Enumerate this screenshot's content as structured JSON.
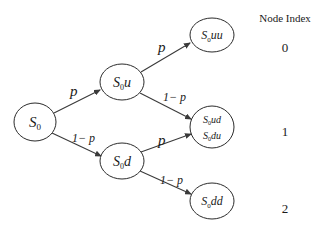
{
  "index_header": "Node Index",
  "node_indices": [
    "0",
    "1",
    "2"
  ],
  "nodes": [
    {
      "id": "S0",
      "base": "S",
      "sub": "0",
      "suffix": "",
      "cx": 35,
      "cy": 122,
      "rx": 21,
      "ry": 19
    },
    {
      "id": "S0u",
      "base": "S",
      "sub": "0",
      "suffix": "u",
      "cx": 122,
      "cy": 82,
      "rx": 22,
      "ry": 18
    },
    {
      "id": "S0d",
      "base": "S",
      "sub": "0",
      "suffix": "d",
      "cx": 122,
      "cy": 161,
      "rx": 22,
      "ry": 18
    },
    {
      "id": "S0uu",
      "base": "S",
      "sub": "0",
      "suffix": "uu",
      "cx": 212,
      "cy": 35,
      "rx": 22,
      "ry": 17
    },
    {
      "id": "S0ud_du",
      "lines": [
        {
          "base": "S",
          "sub": "0",
          "suffix": "ud"
        },
        {
          "base": "S",
          "sub": "0",
          "suffix": "du"
        }
      ],
      "cx": 212,
      "cy": 127,
      "rx": 22,
      "ry": 21
    },
    {
      "id": "S0dd",
      "base": "S",
      "sub": "0",
      "suffix": "dd",
      "cx": 212,
      "cy": 201,
      "rx": 22,
      "ry": 18
    }
  ],
  "edges": [
    {
      "from": "S0",
      "to": "S0u",
      "label": "p"
    },
    {
      "from": "S0",
      "to": "S0d",
      "label": "1 − p"
    },
    {
      "from": "S0u",
      "to": "S0uu",
      "label": "p"
    },
    {
      "from": "S0u",
      "to": "S0ud_du",
      "label": "1 − p"
    },
    {
      "from": "S0d",
      "to": "S0ud_du",
      "label": "p"
    },
    {
      "from": "S0d",
      "to": "S0dd",
      "label": "1 − p"
    }
  ],
  "labels": {
    "e_s0_s0u": "p",
    "e_s0_s0d": "1− p",
    "e_s0u_s0uu": "p",
    "e_s0u_s0ud": "1− p",
    "e_s0d_s0du": "p",
    "e_s0d_s0dd": "1− p"
  },
  "node_text": {
    "s0": {
      "base": "S",
      "sub": "0",
      "suffix": ""
    },
    "s0u": {
      "base": "S",
      "sub": "0",
      "suffix": "u"
    },
    "s0d": {
      "base": "S",
      "sub": "0",
      "suffix": "d"
    },
    "s0uu": {
      "base": "S",
      "sub": "0",
      "suffix": "uu"
    },
    "s0ud": {
      "base": "S",
      "sub": "0",
      "suffix": "ud"
    },
    "s0du": {
      "base": "S",
      "sub": "0",
      "suffix": "du"
    },
    "s0dd": {
      "base": "S",
      "sub": "0",
      "suffix": "dd"
    }
  },
  "colors": {
    "stroke": "#2b2b2b",
    "text": "#1a1a1a",
    "background": "#ffffff"
  }
}
